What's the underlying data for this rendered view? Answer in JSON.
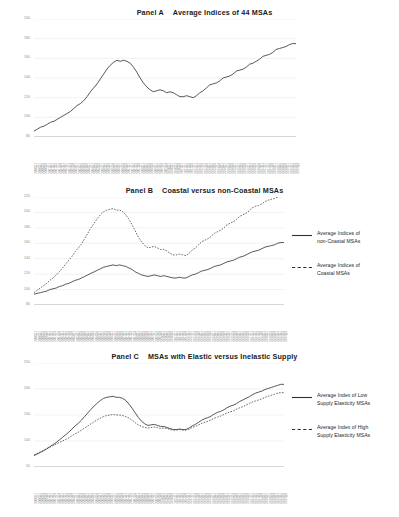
{
  "document": {
    "background": "#ffffff",
    "line_color": "#3a3a3a",
    "grid_color": "#e9e9e9"
  },
  "panels": [
    {
      "id": "A",
      "label": "Panel A",
      "title": "Average Indices of 44 MSAs",
      "ylabels": [
        "200",
        "180",
        "160",
        "140",
        "120",
        "100",
        "80"
      ]
    },
    {
      "id": "B",
      "label": "Panel B",
      "title": "Coastal versus non-Coastal MSAs",
      "ylabels": [
        "220",
        "200",
        "180",
        "160",
        "140",
        "120",
        "100",
        "80"
      ],
      "legend": [
        {
          "style": "solid",
          "line1": "Average Indices of",
          "line2": "non-Coastal MSAs"
        },
        {
          "style": "dashed",
          "line1": "Average Indices of",
          "line2": "Coastal MSAs"
        }
      ]
    },
    {
      "id": "C",
      "label": "Panel C",
      "title": "MSAs with Elastic versus Inelastic Supply",
      "ylabels": [
        "250",
        "200",
        "150",
        "100",
        "50"
      ],
      "legend": [
        {
          "style": "solid",
          "line1": "Average Index of Low",
          "line2": "Supply Elasticity MSAs"
        },
        {
          "style": "dashed",
          "line1": "Average Index of High",
          "line2": "Supply Elasticity MSAs"
        }
      ]
    }
  ],
  "chart_data": [
    {
      "type": "line",
      "panel": "A",
      "title": "Panel A   Average Indices of 44 MSAs",
      "xlabel": "",
      "ylabel": "",
      "ylim": [
        80,
        200
      ],
      "grid": true,
      "legend_position": "none",
      "x": [
        "2000Q1",
        "2000Q2",
        "2000Q3",
        "2000Q4",
        "2001Q1",
        "2001Q2",
        "2001Q3",
        "2001Q4",
        "2002Q1",
        "2002Q2",
        "2002Q3",
        "2002Q4",
        "2003Q1",
        "2003Q2",
        "2003Q3",
        "2003Q4",
        "2004Q1",
        "2004Q2",
        "2004Q3",
        "2004Q4",
        "2005Q1",
        "2005Q2",
        "2005Q3",
        "2005Q4",
        "2006Q1",
        "2006Q2",
        "2006Q3",
        "2006Q4",
        "2007Q1",
        "2007Q2",
        "2007Q3",
        "2007Q4",
        "2008Q1",
        "2008Q2",
        "2008Q3",
        "2008Q4",
        "2009Q1",
        "2009Q2",
        "2009Q3",
        "2009Q4",
        "2010Q1",
        "2010Q2",
        "2010Q3",
        "2010Q4",
        "2011Q1",
        "2011Q2",
        "2011Q3",
        "2011Q4",
        "2012Q1",
        "2012Q2",
        "2012Q3",
        "2012Q4",
        "2013Q1",
        "2013Q2",
        "2013Q3",
        "2013Q4",
        "2014Q1",
        "2014Q2",
        "2014Q3",
        "2014Q4",
        "2015Q1",
        "2015Q2",
        "2015Q3",
        "2015Q4",
        "2016Q1",
        "2016Q2",
        "2016Q3",
        "2016Q4",
        "2017Q1",
        "2017Q2",
        "2017Q3",
        "2017Q4",
        "2018Q1",
        "2018Q2",
        "2018Q3",
        "2018Q4",
        "2019Q1",
        "2019Q2",
        "2019Q3",
        "2019Q4"
      ],
      "series": [
        {
          "name": "Average Indices of 44 MSAs",
          "style": "solid",
          "values": [
            86,
            88,
            90,
            91,
            93,
            95,
            96,
            98,
            100,
            102,
            104,
            106,
            109,
            112,
            114,
            117,
            121,
            126,
            130,
            134,
            139,
            144,
            149,
            153,
            156,
            158,
            157,
            158,
            157,
            155,
            151,
            146,
            140,
            135,
            131,
            128,
            126,
            127,
            128,
            127,
            125,
            126,
            125,
            123,
            121,
            121,
            122,
            121,
            120,
            122,
            125,
            127,
            130,
            133,
            134,
            135,
            137,
            140,
            141,
            142,
            144,
            147,
            148,
            149,
            151,
            154,
            155,
            157,
            159,
            162,
            163,
            164,
            166,
            169,
            170,
            171,
            172,
            174,
            175,
            175
          ]
        }
      ]
    },
    {
      "type": "line",
      "panel": "B",
      "title": "Panel B   Coastal versus non-Coastal MSAs",
      "xlabel": "",
      "ylabel": "",
      "ylim": [
        80,
        220
      ],
      "grid": true,
      "legend_position": "right",
      "x": [
        "2000Q1",
        "2000Q2",
        "2000Q3",
        "2000Q4",
        "2001Q1",
        "2001Q2",
        "2001Q3",
        "2001Q4",
        "2002Q1",
        "2002Q2",
        "2002Q3",
        "2002Q4",
        "2003Q1",
        "2003Q2",
        "2003Q3",
        "2003Q4",
        "2004Q1",
        "2004Q2",
        "2004Q3",
        "2004Q4",
        "2005Q1",
        "2005Q2",
        "2005Q3",
        "2005Q4",
        "2006Q1",
        "2006Q2",
        "2006Q3",
        "2006Q4",
        "2007Q1",
        "2007Q2",
        "2007Q3",
        "2007Q4",
        "2008Q1",
        "2008Q2",
        "2008Q3",
        "2008Q4",
        "2009Q1",
        "2009Q2",
        "2009Q3",
        "2009Q4",
        "2010Q1",
        "2010Q2",
        "2010Q3",
        "2010Q4",
        "2011Q1",
        "2011Q2",
        "2011Q3",
        "2011Q4",
        "2012Q1",
        "2012Q2",
        "2012Q3",
        "2012Q4",
        "2013Q1",
        "2013Q2",
        "2013Q3",
        "2013Q4",
        "2014Q1",
        "2014Q2",
        "2014Q3",
        "2014Q4",
        "2015Q1",
        "2015Q2",
        "2015Q3",
        "2015Q4",
        "2016Q1",
        "2016Q2",
        "2016Q3",
        "2016Q4",
        "2017Q1",
        "2017Q2",
        "2017Q3",
        "2017Q4",
        "2018Q1",
        "2018Q2",
        "2018Q3",
        "2018Q4",
        "2019Q1",
        "2019Q2",
        "2019Q3",
        "2019Q4"
      ],
      "series": [
        {
          "name": "Average Indices of non-Coastal MSAs",
          "style": "solid",
          "values": [
            94,
            95,
            96,
            97,
            98,
            100,
            101,
            102,
            104,
            105,
            107,
            108,
            110,
            112,
            113,
            115,
            117,
            119,
            121,
            123,
            125,
            127,
            129,
            130,
            131,
            132,
            131,
            132,
            131,
            130,
            128,
            126,
            123,
            121,
            119,
            118,
            117,
            118,
            119,
            118,
            117,
            118,
            117,
            116,
            115,
            115,
            116,
            115,
            115,
            117,
            119,
            120,
            122,
            124,
            125,
            126,
            128,
            130,
            131,
            132,
            134,
            136,
            137,
            138,
            140,
            142,
            143,
            145,
            147,
            149,
            150,
            151,
            153,
            155,
            156,
            157,
            158,
            160,
            161,
            161
          ]
        },
        {
          "name": "Average Indices of Coastal MSAs",
          "style": "dashed",
          "values": [
            96,
            99,
            102,
            105,
            108,
            112,
            115,
            119,
            123,
            128,
            133,
            138,
            143,
            149,
            154,
            159,
            166,
            173,
            180,
            186,
            192,
            197,
            201,
            203,
            204,
            205,
            203,
            203,
            201,
            197,
            191,
            184,
            176,
            168,
            162,
            157,
            154,
            155,
            156,
            154,
            152,
            152,
            150,
            147,
            145,
            145,
            146,
            145,
            144,
            147,
            151,
            154,
            158,
            162,
            164,
            166,
            169,
            173,
            175,
            177,
            180,
            184,
            186,
            188,
            191,
            195,
            197,
            199,
            202,
            206,
            208,
            209,
            211,
            214,
            216,
            217,
            218,
            220,
            221,
            221
          ]
        }
      ]
    },
    {
      "type": "line",
      "panel": "C",
      "title": "Panel C   MSAs with Elastic versus Inelastic Supply",
      "xlabel": "",
      "ylabel": "",
      "ylim": [
        50,
        250
      ],
      "grid": true,
      "legend_position": "right",
      "x": [
        "2000Q1",
        "2000Q2",
        "2000Q3",
        "2000Q4",
        "2001Q1",
        "2001Q2",
        "2001Q3",
        "2001Q4",
        "2002Q1",
        "2002Q2",
        "2002Q3",
        "2002Q4",
        "2003Q1",
        "2003Q2",
        "2003Q3",
        "2003Q4",
        "2004Q1",
        "2004Q2",
        "2004Q3",
        "2004Q4",
        "2005Q1",
        "2005Q2",
        "2005Q3",
        "2005Q4",
        "2006Q1",
        "2006Q2",
        "2006Q3",
        "2006Q4",
        "2007Q1",
        "2007Q2",
        "2007Q3",
        "2007Q4",
        "2008Q1",
        "2008Q2",
        "2008Q3",
        "2008Q4",
        "2009Q1",
        "2009Q2",
        "2009Q3",
        "2009Q4",
        "2010Q1",
        "2010Q2",
        "2010Q3",
        "2010Q4",
        "2011Q1",
        "2011Q2",
        "2011Q3",
        "2011Q4",
        "2012Q1",
        "2012Q2",
        "2012Q3",
        "2012Q4",
        "2013Q1",
        "2013Q2",
        "2013Q3",
        "2013Q4",
        "2014Q1",
        "2014Q2",
        "2014Q3",
        "2014Q4",
        "2015Q1",
        "2015Q2",
        "2015Q3",
        "2015Q4",
        "2016Q1",
        "2016Q2",
        "2016Q3",
        "2016Q4",
        "2017Q1",
        "2017Q2",
        "2017Q3",
        "2017Q4",
        "2018Q1",
        "2018Q2",
        "2018Q3",
        "2018Q4",
        "2019Q1",
        "2019Q2",
        "2019Q3",
        "2019Q4"
      ],
      "series": [
        {
          "name": "Average Index of Low Supply Elasticity MSAs",
          "style": "solid",
          "values": [
            72,
            75,
            78,
            81,
            85,
            89,
            93,
            97,
            102,
            107,
            112,
            117,
            123,
            129,
            134,
            140,
            147,
            154,
            161,
            167,
            173,
            178,
            182,
            184,
            185,
            186,
            184,
            184,
            182,
            178,
            171,
            163,
            154,
            145,
            138,
            133,
            130,
            131,
            132,
            130,
            128,
            128,
            126,
            124,
            122,
            122,
            123,
            122,
            122,
            125,
            129,
            132,
            136,
            140,
            143,
            145,
            148,
            152,
            155,
            157,
            160,
            164,
            167,
            169,
            172,
            176,
            179,
            182,
            185,
            189,
            192,
            194,
            196,
            199,
            201,
            203,
            205,
            207,
            209,
            209
          ]
        },
        {
          "name": "Average Index of High Supply Elasticity MSAs",
          "style": "dashed",
          "values": [
            73,
            76,
            79,
            82,
            85,
            88,
            91,
            94,
            97,
            100,
            103,
            106,
            110,
            114,
            117,
            121,
            125,
            129,
            133,
            137,
            141,
            144,
            147,
            149,
            150,
            151,
            150,
            150,
            149,
            147,
            144,
            140,
            135,
            131,
            128,
            126,
            125,
            126,
            127,
            126,
            124,
            125,
            124,
            122,
            121,
            121,
            122,
            121,
            121,
            123,
            126,
            128,
            131,
            134,
            136,
            138,
            141,
            144,
            146,
            148,
            151,
            154,
            156,
            158,
            161,
            164,
            166,
            169,
            172,
            175,
            177,
            179,
            181,
            184,
            186,
            188,
            190,
            192,
            193,
            193
          ]
        }
      ]
    }
  ]
}
